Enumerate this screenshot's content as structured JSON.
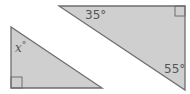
{
  "colors": {
    "fill": "#cfcfcf",
    "stroke": "#6e6e6e",
    "label": "#555555"
  },
  "triangle_left": {
    "vertices": [
      [
        11,
        27
      ],
      [
        11,
        88
      ],
      [
        102,
        88
      ]
    ],
    "right_angle_corner": "bottom-left",
    "angle_label_var": "x",
    "angle_label_deg": "°"
  },
  "triangle_right": {
    "vertices": [
      [
        59,
        6
      ],
      [
        185,
        6
      ],
      [
        185,
        90
      ]
    ],
    "right_angle_corner": "top-right",
    "angle_label_top": "35°",
    "angle_label_bottom": "55°"
  }
}
